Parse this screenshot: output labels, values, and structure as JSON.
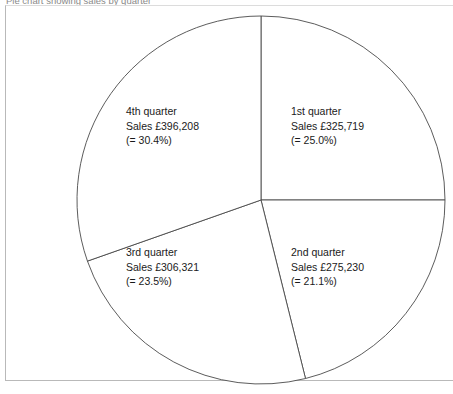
{
  "caption": {
    "text": "Pie chart showing sales by quarter"
  },
  "chart_data": {
    "type": "pie",
    "title": "Pie chart showing sales by quarter",
    "currency_symbol": "£",
    "start_angle_deg": 0,
    "direction": "clockwise",
    "categories": [
      "1st quarter",
      "2nd quarter",
      "3rd quarter",
      "4th quarter"
    ],
    "values": [
      325719,
      275230,
      306321,
      396208
    ],
    "percentages": [
      25.0,
      21.1,
      23.5,
      30.4
    ],
    "total": 1303478,
    "legend": "none",
    "grid": false,
    "slices": [
      {
        "id": "q1",
        "name": "1st quarter",
        "sales_line": "Sales £325,719",
        "pct_line": "(= 25.0%)",
        "value": 325719,
        "percent": 25.0,
        "start_deg": 0,
        "end_deg": 90,
        "fill": "#ffffff",
        "stroke": "#4a4a4a"
      },
      {
        "id": "q2",
        "name": "2nd quarter",
        "sales_line": "Sales £275,230",
        "pct_line": "(= 21.1%)",
        "value": 275230,
        "percent": 21.1,
        "start_deg": 90,
        "end_deg": 166,
        "fill": "#ffffff",
        "stroke": "#4a4a4a"
      },
      {
        "id": "q3",
        "name": "3rd quarter",
        "sales_line": "Sales £306,321",
        "pct_line": "(= 23.5%)",
        "value": 306321,
        "percent": 23.5,
        "start_deg": 166,
        "end_deg": 250.6,
        "fill": "#ffffff",
        "stroke": "#4a4a4a"
      },
      {
        "id": "q4",
        "name": "4th quarter",
        "sales_line": "Sales £396,208",
        "pct_line": "(= 30.4%)",
        "value": 396208,
        "percent": 30.4,
        "start_deg": 250.6,
        "end_deg": 360,
        "fill": "#ffffff",
        "stroke": "#4a4a4a"
      }
    ],
    "geometry": {
      "center_x": 261,
      "center_y": 200,
      "radius": 184
    },
    "colors": {
      "outline": "#4a4a4a",
      "frame": "#b9b9b9",
      "background": "#ffffff",
      "text": "#1a1a1a"
    }
  }
}
